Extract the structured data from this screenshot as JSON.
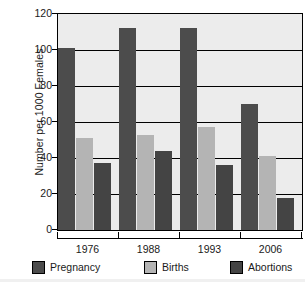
{
  "chart_data": {
    "type": "bar",
    "title": "",
    "subtitle": "",
    "xlabel": "",
    "ylabel": "Number per 1000 Females",
    "categories": [
      "1976",
      "1988",
      "1993",
      "2006"
    ],
    "series": [
      {
        "name": "Pregnancy",
        "color": "#4c4c4c",
        "values": [
          101,
          112,
          112,
          70
        ]
      },
      {
        "name": "Births",
        "color": "#b4b4b4",
        "values": [
          51,
          53,
          57,
          41
        ]
      },
      {
        "name": "Abortions",
        "color": "#444444",
        "values": [
          37,
          44,
          36,
          18
        ]
      }
    ],
    "ylim": [
      0,
      120
    ],
    "ytick_step": 20,
    "yticks": [
      "0",
      "20",
      "40",
      "60",
      "80",
      "100",
      "120"
    ],
    "grid": "horizontal",
    "legend_position": "bottom",
    "plot_background": "#ececec",
    "axis_color": "#000000"
  }
}
